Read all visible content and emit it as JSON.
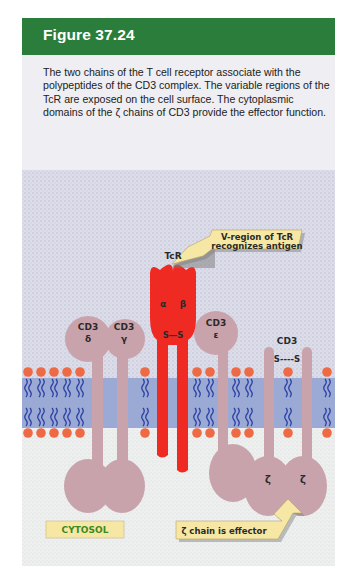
{
  "figure": {
    "title": "Figure 37.24",
    "caption": "The two chains of the T cell receptor associate with the polypeptides of the CD3 complex. The variable regions of the TcR are exposed on the cell surface. The cytoplasmic domains of the ζ chains of CD3 provide the effector function."
  },
  "diagram": {
    "callouts": {
      "v_region_line1": "V-region of TcR",
      "v_region_line2": "recognizes antigen",
      "zeta_effector": "ζ chain is effector",
      "cytosol": "CYTOSOL"
    },
    "tcr": {
      "label": "TcR",
      "alpha": "α",
      "beta": "β",
      "disulfide": "S—S"
    },
    "cd3_delta": {
      "label": "CD3",
      "subunit": "δ"
    },
    "cd3_gamma": {
      "label": "CD3",
      "subunit": "γ"
    },
    "cd3_epsilon": {
      "label": "CD3",
      "subunit": "ε"
    },
    "cd3_zeta": {
      "label": "CD3",
      "disulfide": "S----S",
      "subunit_left": "ζ",
      "subunit_right": "ζ"
    }
  },
  "colors": {
    "header_green": "#2a7d3a",
    "tcr_red": "#ee2a22",
    "cd3_mauve": "#c9a3ac",
    "membrane_blue": "#9aaad4",
    "lipid_tail_blue": "#2b3fa3",
    "lipid_head_orange": "#ee6a45",
    "callout_yellow": "#f7e7a4",
    "cytosol_text_green": "#3b8a1f"
  }
}
